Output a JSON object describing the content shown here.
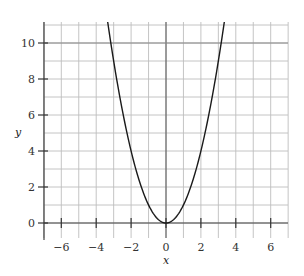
{
  "chart_data": {
    "type": "line",
    "title": "",
    "xlabel": "x",
    "ylabel": "y",
    "xlim": [
      -7,
      7
    ],
    "ylim": [
      -0.8,
      11.2
    ],
    "grid": true,
    "grid_step_x": 1,
    "grid_step_y": 1,
    "x_ticks": [
      -6,
      -4,
      -2,
      0,
      2,
      4,
      6
    ],
    "x_tick_labels": [
      "−6",
      "−4",
      "−2",
      "0",
      "2",
      "4",
      "6"
    ],
    "y_ticks": [
      0,
      2,
      4,
      6,
      8,
      10
    ],
    "y_tick_labels": [
      "0",
      "2",
      "4",
      "6",
      "8",
      "10"
    ],
    "series": [
      {
        "name": "y = x^2",
        "function": "x^2",
        "x": [
          -3.35,
          -3,
          -2.5,
          -2,
          -1.5,
          -1,
          -0.5,
          0,
          0.5,
          1,
          1.5,
          2,
          2.5,
          3,
          3.35
        ],
        "y": [
          11.22,
          9,
          6.25,
          4,
          2.25,
          1,
          0.25,
          0,
          0.25,
          1,
          2.25,
          4,
          6.25,
          9,
          11.22
        ],
        "color": "#1a1a1a"
      }
    ],
    "colors": {
      "curve": "#1a1a1a",
      "grid": "#bdbdbd",
      "axis": "#444444"
    }
  }
}
